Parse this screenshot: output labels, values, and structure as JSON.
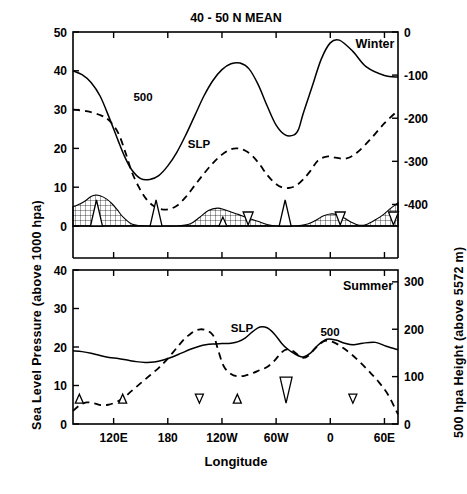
{
  "figure": {
    "title": "40 - 50 N  MEAN",
    "xlabel": "Longitude",
    "ylabel_left": "Sea Level Pressure  (above 1000 hpa)",
    "ylabel_right": "500 hpa Height  (above 5572 m)",
    "caption": ""
  },
  "axes": {
    "x_ticklabels": [
      "120E",
      "180",
      "120W",
      "60W",
      "0",
      "60E"
    ],
    "x_tickvalues": [
      120,
      180,
      240,
      300,
      360,
      420
    ],
    "x_range": [
      75,
      435
    ]
  },
  "chart_data": [
    {
      "type": "line",
      "panel": "winter",
      "panel_label": "Winter",
      "title": "40 - 50 N  MEAN",
      "xlabel": "Longitude",
      "ylabel": "Sea Level Pressure  (above 1000 hpa)",
      "ylabel_right": "500 hpa Height  (above 5572 m)",
      "ylim": [
        0,
        50
      ],
      "y_ticklabels": [
        "0",
        "10",
        "20",
        "30",
        "40",
        "50"
      ],
      "y_tickvalues": [
        0,
        10,
        20,
        30,
        40,
        50
      ],
      "ylim_right": [
        -450,
        0
      ],
      "y_ticklabels_right": [
        "0",
        "-100",
        "-200",
        "-300",
        "-400"
      ],
      "y_tickvalues_right": [
        0,
        -100,
        -200,
        -300,
        -400
      ],
      "grid": false,
      "legend": "inline-curve-labels",
      "series": [
        {
          "name": "500",
          "style": "solid",
          "label_text": "500",
          "x": [
            75,
            85,
            95,
            105,
            115,
            125,
            132,
            140,
            150,
            160,
            170,
            180,
            190,
            200,
            210,
            220,
            230,
            240,
            250,
            260,
            270,
            280,
            290,
            300,
            310,
            320,
            325,
            330,
            340,
            350,
            360,
            370,
            385,
            400,
            420,
            435
          ],
          "y": [
            40.0,
            39.0,
            37.0,
            33.5,
            28.0,
            22.0,
            18.0,
            14.5,
            12.2,
            12.0,
            13.0,
            15.5,
            19.0,
            23.5,
            28.5,
            33.5,
            37.5,
            40.3,
            41.8,
            42.0,
            40.5,
            36.5,
            31.0,
            26.0,
            23.5,
            23.5,
            25.0,
            29.0,
            36.0,
            43.0,
            47.2,
            47.9,
            45.0,
            41.0,
            38.8,
            38.4
          ]
        },
        {
          "name": "SLP",
          "style": "dashed",
          "label_text": "SLP",
          "x": [
            75,
            90,
            105,
            115,
            125,
            133,
            140,
            148,
            156,
            164,
            172,
            180,
            190,
            200,
            210,
            220,
            230,
            240,
            250,
            258,
            266,
            274,
            282,
            290,
            298,
            306,
            314,
            322,
            330,
            338,
            346,
            356,
            366,
            378,
            390,
            405,
            420,
            435
          ],
          "y": [
            30.0,
            29.6,
            28.6,
            27.2,
            24.0,
            19.0,
            14.0,
            10.0,
            7.0,
            5.2,
            4.4,
            4.3,
            5.2,
            7.5,
            10.5,
            13.5,
            16.2,
            18.4,
            19.8,
            20.0,
            19.4,
            18.0,
            15.8,
            13.2,
            11.2,
            10.0,
            9.8,
            10.4,
            12.0,
            14.2,
            16.8,
            17.9,
            17.6,
            17.4,
            19.0,
            22.5,
            26.5,
            29.8
          ]
        }
      ],
      "markers": {
        "up_triangles": [
          {
            "x": 101,
            "size": "large"
          },
          {
            "x": 167,
            "size": "large"
          },
          {
            "x": 241,
            "size": "small"
          },
          {
            "x": 310,
            "size": "large"
          }
        ],
        "down_triangles": [
          {
            "x": 269,
            "size": "medium"
          },
          {
            "x": 371,
            "size": "medium"
          },
          {
            "x": 430,
            "size": "medium"
          }
        ]
      },
      "topography": {
        "description": "cross-hatched terrain profile along baseline",
        "x": [
          75,
          80,
          88,
          95,
          100,
          105,
          112,
          118,
          124,
          130,
          140,
          150,
          160,
          175,
          190,
          205,
          215,
          225,
          235,
          243,
          250,
          258,
          265,
          272,
          280,
          290,
          300,
          320,
          335,
          345,
          352,
          360,
          368,
          376,
          384,
          392,
          400,
          410,
          418,
          426,
          435
        ],
        "y": [
          5.0,
          5.4,
          6.4,
          7.6,
          8.0,
          7.8,
          7.0,
          5.8,
          4.2,
          2.4,
          0.5,
          0.1,
          0.0,
          0.0,
          0.0,
          0.6,
          2.2,
          4.0,
          4.6,
          4.2,
          3.6,
          3.0,
          2.4,
          1.8,
          1.2,
          0.4,
          0.0,
          0.0,
          0.5,
          1.6,
          2.6,
          3.1,
          2.9,
          2.0,
          0.9,
          0.2,
          0.4,
          1.6,
          2.8,
          4.4,
          6.0
        ]
      }
    },
    {
      "type": "line",
      "panel": "summer",
      "panel_label": "Summer",
      "xlabel": "Longitude",
      "ylim": [
        0,
        40
      ],
      "y_ticklabels": [
        "0",
        "10",
        "20",
        "30",
        "40"
      ],
      "y_tickvalues": [
        0,
        10,
        20,
        30,
        40
      ],
      "ylim_right": [
        0,
        325
      ],
      "y_ticklabels_right": [
        "0",
        "100",
        "200",
        "300"
      ],
      "y_tickvalues_right": [
        0,
        100,
        200,
        300
      ],
      "grid": false,
      "series": [
        {
          "name": "500",
          "style": "solid",
          "label_text": "500",
          "x": [
            75,
            85,
            95,
            105,
            115,
            125,
            135,
            145,
            155,
            165,
            175,
            185,
            195,
            205,
            215,
            222,
            230,
            240,
            250,
            258,
            266,
            274,
            282,
            290,
            298,
            306,
            312,
            318,
            324,
            330,
            338,
            346,
            356,
            366,
            376,
            386,
            396,
            410,
            422,
            435
          ],
          "y": [
            19.0,
            18.8,
            18.4,
            17.8,
            17.3,
            17.0,
            16.6,
            16.2,
            16.0,
            16.1,
            16.6,
            17.4,
            18.4,
            19.4,
            20.2,
            20.6,
            20.8,
            20.9,
            21.0,
            21.4,
            22.4,
            24.0,
            25.2,
            25.0,
            23.4,
            21.0,
            19.6,
            18.6,
            17.8,
            17.4,
            18.4,
            20.4,
            22.0,
            21.8,
            21.0,
            20.6,
            21.0,
            21.2,
            20.2,
            19.3
          ]
        },
        {
          "name": "SLP",
          "style": "dashed",
          "label_text": "SLP",
          "x": [
            75,
            82,
            90,
            98,
            106,
            114,
            122,
            130,
            140,
            150,
            160,
            170,
            180,
            190,
            198,
            204,
            210,
            216,
            222,
            228,
            232,
            236,
            242,
            250,
            258,
            266,
            274,
            282,
            290,
            298,
            306,
            312,
            318,
            324,
            330,
            336,
            344,
            354,
            364,
            374,
            384,
            394,
            404,
            414,
            424,
            435
          ],
          "y": [
            3.4,
            4.8,
            5.6,
            5.4,
            4.9,
            5.0,
            5.6,
            6.6,
            8.6,
            10.6,
            12.6,
            14.6,
            17.0,
            19.8,
            22.0,
            23.2,
            24.2,
            24.6,
            24.4,
            23.6,
            22.2,
            19.0,
            15.0,
            13.0,
            12.4,
            12.6,
            13.2,
            14.0,
            14.8,
            16.4,
            18.6,
            19.4,
            19.0,
            18.0,
            17.2,
            17.8,
            19.8,
            21.6,
            21.2,
            19.8,
            18.0,
            15.8,
            13.4,
            10.8,
            7.6,
            2.5
          ]
        }
      ],
      "markers": {
        "up_triangles": [
          {
            "x": 82,
            "size": "small"
          },
          {
            "x": 130,
            "size": "small"
          },
          {
            "x": 257,
            "size": "small"
          }
        ],
        "down_triangles": [
          {
            "x": 215,
            "size": "small"
          },
          {
            "x": 311,
            "size": "large"
          },
          {
            "x": 385,
            "size": "small"
          }
        ]
      }
    }
  ]
}
